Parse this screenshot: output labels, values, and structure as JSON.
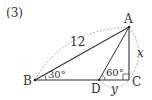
{
  "problem": {
    "number_label": "(3)"
  },
  "diagram": {
    "type": "right-triangle",
    "points": {
      "A": {
        "label": "A",
        "x": 129,
        "y": 27
      },
      "B": {
        "label": "B",
        "x": 35,
        "y": 80
      },
      "C": {
        "label": "C",
        "x": 129,
        "y": 80
      },
      "D": {
        "label": "D",
        "x": 99,
        "y": 80
      }
    },
    "measures": {
      "AB": "12",
      "angle_B": "30°",
      "angle_ADC": "60°",
      "AC": "x",
      "DC": "y"
    },
    "right_angle_at": "C",
    "colors": {
      "line": "#333333",
      "dashed": "#999999"
    }
  }
}
